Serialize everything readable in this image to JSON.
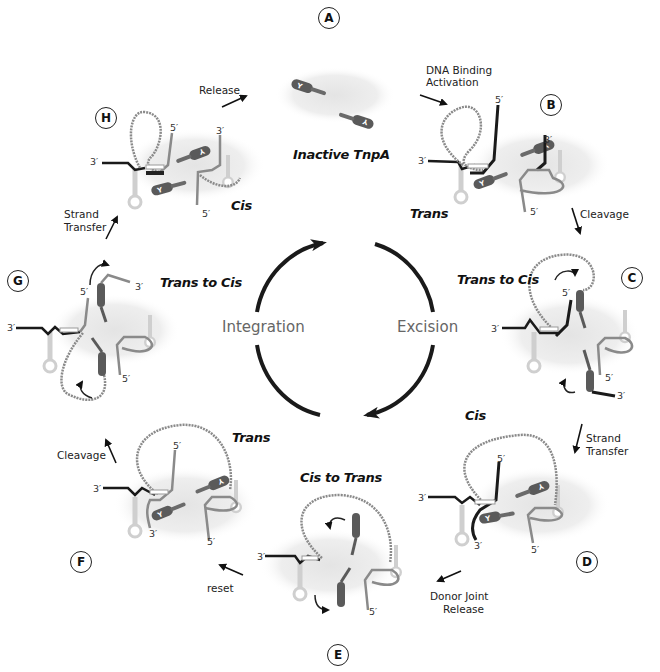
{
  "figure": {
    "center": {
      "left_label": "Integration",
      "right_label": "Excision"
    },
    "steps": [
      {
        "id": "A",
        "state": "Inactive TnpA"
      },
      {
        "id": "B",
        "state": "Trans"
      },
      {
        "id": "C",
        "state": "Trans to Cis"
      },
      {
        "id": "D",
        "state": "Cis"
      },
      {
        "id": "E",
        "state": "Cis to Trans"
      },
      {
        "id": "F",
        "state": "Trans"
      },
      {
        "id": "G",
        "state": "Trans to Cis"
      },
      {
        "id": "H",
        "state": "Cis"
      }
    ],
    "transitions": {
      "A_to_B_line1": "DNA Binding",
      "A_to_B_line2": "Activation",
      "B_to_C": "Cleavage",
      "C_to_D_line1": "Strand",
      "C_to_D_line2": "Transfer",
      "D_to_E_line1": "Donor Joint",
      "D_to_E_line2": "Release",
      "E_to_F": "reset",
      "F_to_G": "Cleavage",
      "G_to_H_line1": "Strand",
      "G_to_H_line2": "Transfer",
      "H_to_A": "Release"
    },
    "strand_ends": {
      "three_prime": "3′",
      "five_prime": "5′"
    },
    "protein_marker": "Y",
    "colors": {
      "cycle_arrow": "#1a1a1a",
      "strand_dark": "#1a1a1a",
      "strand_gray": "#7a7a7a",
      "protein": "#5a5a5a",
      "hairpin": "#cfcfcf",
      "halo": "#ececec"
    }
  }
}
